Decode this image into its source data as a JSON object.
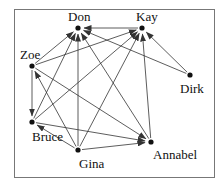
{
  "diagram": {
    "type": "directed-graph",
    "colors": {
      "edge": "#333333",
      "node": "#111111",
      "frame": "#777777",
      "background": "#ffffff"
    },
    "nodes": [
      {
        "id": "Don",
        "label": "Don",
        "x": 78,
        "y": 28,
        "lx": 68,
        "ly": 10
      },
      {
        "id": "Kay",
        "label": "Kay",
        "x": 142,
        "y": 28,
        "lx": 136,
        "ly": 10
      },
      {
        "id": "Zoe",
        "label": "Zoe",
        "x": 32,
        "y": 66,
        "lx": 20,
        "ly": 48
      },
      {
        "id": "Dirk",
        "label": "Dirk",
        "x": 190,
        "y": 75,
        "lx": 180,
        "ly": 82
      },
      {
        "id": "Bruce",
        "label": "Bruce",
        "x": 32,
        "y": 122,
        "lx": 32,
        "ly": 130
      },
      {
        "id": "Gina",
        "label": "Gina",
        "x": 78,
        "y": 150,
        "lx": 79,
        "ly": 157
      },
      {
        "id": "Annabel",
        "label": "Annabel",
        "x": 151,
        "y": 142,
        "lx": 153,
        "ly": 148
      }
    ],
    "edges": [
      {
        "from": "Kay",
        "to": "Don"
      },
      {
        "from": "Dirk",
        "to": "Kay"
      },
      {
        "from": "Dirk",
        "to": "Don"
      },
      {
        "from": "Zoe",
        "to": "Don"
      },
      {
        "from": "Zoe",
        "to": "Kay"
      },
      {
        "from": "Zoe",
        "to": "Bruce"
      },
      {
        "from": "Zoe",
        "to": "Annabel"
      },
      {
        "from": "Bruce",
        "to": "Don"
      },
      {
        "from": "Bruce",
        "to": "Kay"
      },
      {
        "from": "Bruce",
        "to": "Annabel"
      },
      {
        "from": "Gina",
        "to": "Don"
      },
      {
        "from": "Gina",
        "to": "Kay"
      },
      {
        "from": "Gina",
        "to": "Zoe"
      },
      {
        "from": "Gina",
        "to": "Bruce"
      },
      {
        "from": "Gina",
        "to": "Annabel"
      },
      {
        "from": "Annabel",
        "to": "Kay"
      },
      {
        "from": "Annabel",
        "to": "Don"
      }
    ]
  },
  "labels": {
    "don": "Don",
    "kay": "Kay",
    "zoe": "Zoe",
    "dirk": "Dirk",
    "bruce": "Bruce",
    "gina": "Gina",
    "annabel": "Annabel"
  }
}
